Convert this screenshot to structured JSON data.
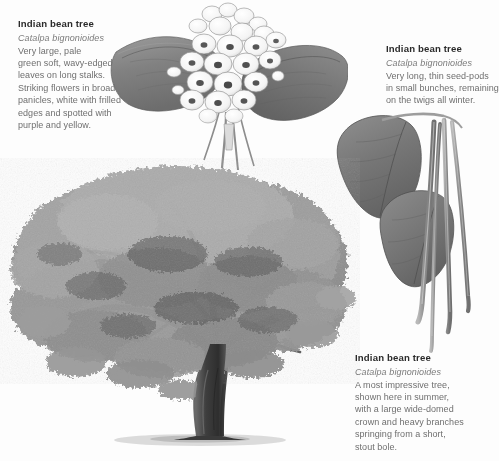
{
  "page": {
    "background": "#fdfdfd",
    "heading_color": "#2b2b2b",
    "scientific_color": "#7b7b7b",
    "body_color": "#6f6f6f",
    "leaf_color": "#8a8a8a",
    "leaf_dark": "#6a6a6a",
    "foliage_color": "#9a9a9a",
    "trunk_color": "#4a4a4a"
  },
  "blocks": {
    "flower": {
      "title": "Indian bean tree",
      "scientific_name": "Catalpa bignonioides",
      "lines": [
        "Very large, pale",
        "green soft, wavy-edged",
        "leaves on long stalks.",
        "Striking flowers in broad",
        "panicles, white with frilled",
        "edges and spotted with",
        "purple and yellow."
      ]
    },
    "pods": {
      "title": "Indian bean tree",
      "scientific_name": "Catalpa bignonioides",
      "lines": [
        "Very long, thin seed-pods",
        "in small bunches, remaining",
        "on the twigs all winter."
      ]
    },
    "tree": {
      "title": "Indian bean tree",
      "scientific_name": "Catalpa bignonioides",
      "lines": [
        "A most impressive tree,",
        "shown here in summer,",
        "with a large wide-domed",
        "crown and heavy branches",
        "springing from a short,",
        "stout bole."
      ]
    }
  },
  "illustrations": {
    "flower": "catalpa-flower-panicle-with-leaves-illustration",
    "pods": "catalpa-seed-pods-with-leaves-illustration",
    "tree": "catalpa-whole-tree-summer-illustration"
  }
}
